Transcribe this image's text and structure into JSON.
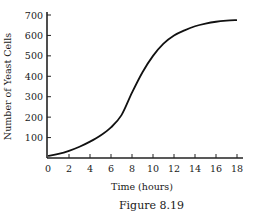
{
  "chart_data": {
    "type": "line",
    "title": "",
    "caption": "Figure 8.19",
    "xlabel": "Time (hours)",
    "ylabel": "Number of Yeast Cells",
    "xlim": [
      0,
      18
    ],
    "ylim": [
      0,
      700
    ],
    "grid": false,
    "legend": null,
    "x_ticks": [
      0,
      2,
      4,
      6,
      8,
      10,
      12,
      14,
      16,
      18
    ],
    "y_ticks": [
      100,
      200,
      300,
      400,
      500,
      600,
      700
    ],
    "series": [
      {
        "name": "Yeast population",
        "x": [
          0,
          1,
          2,
          3,
          4,
          5,
          6,
          7,
          8,
          9,
          10,
          11,
          12,
          13,
          14,
          15,
          16,
          17,
          18
        ],
        "values": [
          10,
          20,
          35,
          55,
          80,
          110,
          150,
          210,
          320,
          420,
          500,
          560,
          600,
          625,
          645,
          658,
          667,
          672,
          675
        ]
      }
    ]
  },
  "labels": {
    "xlabel": "Time (hours)",
    "ylabel": "Number of Yeast Cells",
    "caption": "Figure 8.19"
  }
}
